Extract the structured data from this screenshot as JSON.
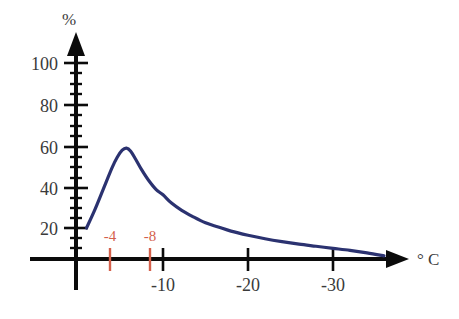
{
  "chart_data": {
    "type": "line",
    "title": "",
    "subtitle": "",
    "xlabel": "° C",
    "ylabel": "%",
    "xlim": [
      0,
      -37
    ],
    "ylim": [
      0,
      110
    ],
    "grid": false,
    "legend": null,
    "series": [
      {
        "name": "ice nucleation frequency",
        "color": "#2b3270",
        "x": [
          -1.0,
          -2.0,
          -3.0,
          -4.0,
          -4.6,
          -5.2,
          -5.7,
          -6.2,
          -6.8,
          -7.5,
          -8.3,
          -9.2,
          -10.0,
          -11.0,
          -12.2,
          -13.5,
          -15.0,
          -16.5,
          -18.0,
          -20.0,
          -22.0,
          -24.0,
          -26.0,
          -28.0,
          -30.0,
          -32.0,
          -34.0,
          -36.0
        ],
        "y": [
          20.0,
          29.0,
          39.0,
          49.0,
          54.0,
          57.5,
          58.5,
          57.0,
          53.0,
          48.0,
          43.0,
          38.5,
          36.0,
          32.0,
          28.5,
          25.5,
          22.5,
          20.5,
          18.5,
          16.5,
          14.8,
          13.4,
          12.2,
          11.2,
          10.2,
          9.2,
          8.0,
          6.6
        ]
      }
    ],
    "axes": {
      "y_ticks": [
        20,
        40,
        60,
        80,
        100
      ],
      "y_tick_labels": [
        "20",
        "40",
        "60",
        "80",
        "100"
      ],
      "y_minor_tick_step": 5,
      "x_ticks": [
        -10,
        -20,
        -30
      ],
      "x_tick_labels": [
        "-10",
        "-20",
        "-30"
      ],
      "y_axis_title": "%",
      "x_axis_title": "° C"
    },
    "annotations": [
      {
        "name": "marker-minus-4",
        "label": "-4",
        "x": -4,
        "color": "#d4604b"
      },
      {
        "name": "marker-minus-8",
        "label": "-8",
        "x": -8.7,
        "color": "#d4604b"
      }
    ],
    "colors": {
      "curve": "#2b3270",
      "axis": "#0b0b0b",
      "tick_text": "#3a3a3a",
      "marker_red": "#d4604b",
      "background": "#ffffff"
    }
  }
}
